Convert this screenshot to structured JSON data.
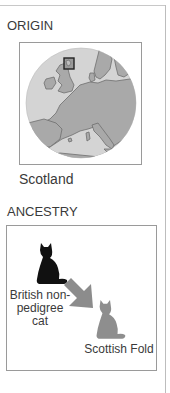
{
  "origin": {
    "heading": "ORIGIN",
    "map": {
      "region": "Europe",
      "highlight": "Scotland",
      "highlight_marker": "square-outline",
      "colors": {
        "sea": "#d4d4d4",
        "land": "#a9a9a9",
        "coast": "#6e6e6e",
        "highlight_border": "#222222"
      }
    },
    "caption": "Scotland"
  },
  "ancestry": {
    "heading": "ANCESTRY",
    "parent": {
      "label": "British non-pedigree cat",
      "icon": "cat-silhouette-icon",
      "color": "#111111"
    },
    "arrow": {
      "icon": "arrow-down-right-icon",
      "color": "#8c8c8c"
    },
    "child": {
      "label": "Scottish Fold",
      "icon": "cat-silhouette-icon",
      "color": "#8e8e8e"
    }
  }
}
